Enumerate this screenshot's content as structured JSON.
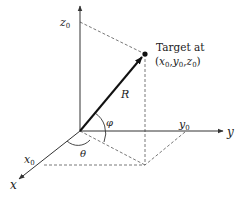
{
  "diagram": {
    "title": "",
    "axes": {
      "x_label": "x",
      "y_label": "y",
      "z_label": "z",
      "x0_label": "x",
      "y0_label": "y",
      "z0_label": "z",
      "subscript": "0"
    },
    "vector_label": "R",
    "angle_phi": "φ",
    "angle_theta": "θ",
    "target": {
      "line1": "Target at",
      "coord_open": "(",
      "coord_x": "x",
      "coord_y": "y",
      "coord_z": "z",
      "coord_sub": "0",
      "comma": ",",
      "coord_close": ")"
    },
    "colors": {
      "axis": "#333333",
      "vector": "#111111",
      "dashed": "#555555"
    }
  }
}
